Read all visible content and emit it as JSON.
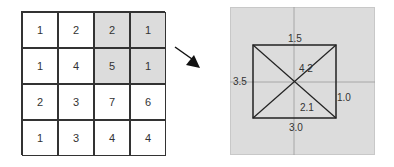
{
  "matrix": {
    "rows": [
      [
        "1",
        "2",
        "2",
        "1"
      ],
      [
        "1",
        "4",
        "5",
        "1"
      ],
      [
        "2",
        "3",
        "7",
        "6"
      ],
      [
        "1",
        "3",
        "4",
        "4"
      ]
    ],
    "shaded_cells": [
      [
        0,
        2
      ],
      [
        0,
        3
      ],
      [
        1,
        2
      ],
      [
        1,
        3
      ]
    ],
    "shade_color": "#dcdcdc"
  },
  "arrow": {
    "direction": "down-right"
  },
  "panel": {
    "background": "#dcdcdc",
    "labels": {
      "top": "1.5",
      "left": "3.5",
      "right": "1.0",
      "bottom": "3.0",
      "diag_upper": "4.2",
      "diag_lower": "2.1"
    }
  }
}
